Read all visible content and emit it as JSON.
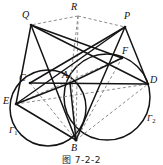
{
  "figure": {
    "caption": "图 7-2-2",
    "stroke_color": "#141414",
    "dash_color": "#8d8d8d",
    "background": "#ffffff"
  },
  "points": [
    {
      "name": "Q",
      "label": "Q",
      "x": 31,
      "y": 25,
      "label_x": 22,
      "label_y": 10
    },
    {
      "name": "R",
      "label": "R",
      "x": 78,
      "y": 16,
      "label_x": 71,
      "label_y": 2
    },
    {
      "name": "P",
      "label": "P",
      "x": 125,
      "y": 27,
      "label_x": 124,
      "label_y": 11
    },
    {
      "name": "F",
      "label": "F",
      "x": 122,
      "y": 58,
      "label_x": 122,
      "label_y": 46
    },
    {
      "name": "C",
      "label": "C",
      "x": 30,
      "y": 83,
      "label_x": 19,
      "label_y": 73
    },
    {
      "name": "A",
      "label": "A",
      "x": 70,
      "y": 83,
      "label_x": 62,
      "label_y": 70
    },
    {
      "name": "D",
      "label": "D",
      "x": 148,
      "y": 84,
      "label_x": 150,
      "label_y": 75
    },
    {
      "name": "E",
      "label": "E",
      "x": 16,
      "y": 104,
      "label_x": 3,
      "label_y": 96
    },
    {
      "name": "B",
      "label": "B",
      "x": 76,
      "y": 140,
      "label_x": 71,
      "label_y": 143
    }
  ],
  "circles": [
    {
      "name": "gamma-1",
      "label": "Γ",
      "subscript": "1",
      "cx": 48,
      "cy": 108,
      "r": 38,
      "label_x": 9,
      "label_y": 126
    },
    {
      "name": "gamma-2",
      "label": "Γ",
      "subscript": "2",
      "cx": 107,
      "cy": 97,
      "r": 43,
      "label_x": 147,
      "label_y": 114
    }
  ],
  "solid_segments": [
    {
      "name": "segment-QE",
      "from": "Q",
      "to": "E"
    },
    {
      "name": "segment-QB",
      "from": "Q",
      "to": "B"
    },
    {
      "name": "segment-QF",
      "from": "Q",
      "to": "F"
    },
    {
      "name": "segment-QD",
      "from": "Q",
      "to": "D"
    },
    {
      "name": "segment-PE",
      "from": "P",
      "to": "E"
    },
    {
      "name": "segment-PC",
      "from": "P",
      "to": "C"
    },
    {
      "name": "segment-PB",
      "from": "P",
      "to": "B"
    },
    {
      "name": "segment-PD",
      "from": "P",
      "to": "D"
    },
    {
      "name": "segment-CD",
      "from": "C",
      "to": "D"
    },
    {
      "name": "segment-EA",
      "from": "E",
      "to": "A"
    },
    {
      "name": "segment-AB",
      "from": "A",
      "to": "B"
    },
    {
      "name": "segment-AF",
      "from": "A",
      "to": "F"
    },
    {
      "name": "segment-EB",
      "from": "E",
      "to": "B"
    }
  ],
  "dashed_segments": [
    {
      "name": "segment-RQ",
      "from": "R",
      "to": "Q"
    },
    {
      "name": "segment-RP",
      "from": "R",
      "to": "P"
    },
    {
      "name": "segment-RA",
      "from": "R",
      "to": "A"
    },
    {
      "name": "segment-RB",
      "from": "R",
      "to": "B"
    },
    {
      "name": "segment-EF",
      "from": "E",
      "to": "F"
    },
    {
      "name": "segment-ED",
      "from": "E",
      "to": "D"
    },
    {
      "name": "segment-BD",
      "from": "B",
      "to": "D"
    },
    {
      "name": "segment-BF",
      "from": "B",
      "to": "F"
    },
    {
      "name": "segment-BC",
      "from": "B",
      "to": "C"
    }
  ]
}
